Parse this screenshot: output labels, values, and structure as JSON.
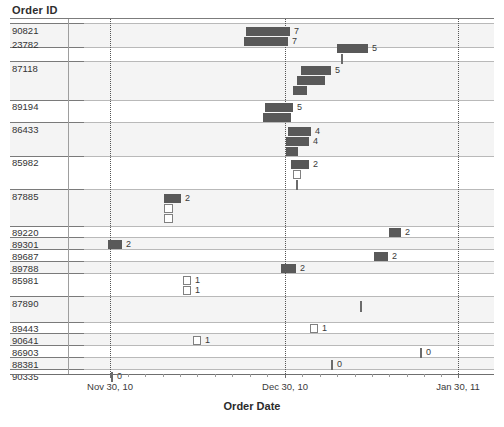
{
  "header": {
    "row_label_title": "Order ID"
  },
  "axis": {
    "title": "Order Date",
    "ticks": [
      {
        "label": "Nov 30, 10",
        "x": 110
      },
      {
        "label": "Dec 30, 10",
        "x": 285
      },
      {
        "label": "Jan 30, 11",
        "x": 458
      }
    ]
  },
  "colors": {
    "bar_fill": "#595959",
    "bar_hollow_stroke": "#808080",
    "band_fill": "#f4f4f4",
    "rule": "#b9b9b9",
    "grid": "#555555"
  },
  "chart_data": {
    "type": "bar",
    "title": "",
    "xlabel": "Order Date",
    "ylabel": "Order ID",
    "grid": true,
    "legend": null,
    "xtick_labels": [
      "Nov 30, 10",
      "Dec 30, 10",
      "Jan 30, 11"
    ],
    "categories": [
      "90821",
      "23782",
      "87118",
      "89194",
      "86433",
      "85982",
      "87885",
      "89220",
      "89301",
      "89687",
      "89788",
      "85981",
      "87890",
      "89443",
      "90641",
      "86903",
      "88381",
      "90335"
    ],
    "bars": [
      {
        "order_id": "90821",
        "value": 7,
        "start": 246,
        "end": 289
      },
      {
        "order_id": "90821",
        "value": 7,
        "start": 244,
        "end": 287
      },
      {
        "order_id": "23782",
        "value": 5,
        "start": 337,
        "end": 367
      },
      {
        "order_id": "23782",
        "value": null,
        "start": 341,
        "end": 342
      },
      {
        "order_id": "87118",
        "value": 5,
        "start": 301,
        "end": 330
      },
      {
        "order_id": "87118",
        "value": null,
        "start": 297,
        "end": 324
      },
      {
        "order_id": "87118",
        "value": null,
        "start": 293,
        "end": 306
      },
      {
        "order_id": "89194",
        "value": 5,
        "start": 265,
        "end": 292
      },
      {
        "order_id": "89194",
        "value": null,
        "start": 263,
        "end": 291
      },
      {
        "order_id": "86433",
        "value": 4,
        "start": 288,
        "end": 310
      },
      {
        "order_id": "86433",
        "value": 4,
        "start": 286,
        "end": 308
      },
      {
        "order_id": "85982",
        "value": null,
        "start": 286,
        "end": 296
      },
      {
        "order_id": "85982",
        "value": 2,
        "start": 291,
        "end": 308
      },
      {
        "order_id": "85982",
        "value": null,
        "start": 293,
        "end": 300
      },
      {
        "order_id": "85982",
        "value": null,
        "start": 296,
        "end": 297
      },
      {
        "order_id": "87885",
        "value": 2,
        "start": 164,
        "end": 180
      },
      {
        "order_id": "87885",
        "value": null,
        "start": 164,
        "end": 172
      },
      {
        "order_id": "87885",
        "value": null,
        "start": 164,
        "end": 172
      },
      {
        "order_id": "89220",
        "value": 2,
        "start": 389,
        "end": 400
      },
      {
        "order_id": "89301",
        "value": 2,
        "start": 108,
        "end": 122
      },
      {
        "order_id": "89687",
        "value": 2,
        "start": 374,
        "end": 388
      },
      {
        "order_id": "89788",
        "value": 2,
        "start": 281,
        "end": 296
      },
      {
        "order_id": "85981",
        "value": 1,
        "start": 183,
        "end": 190
      },
      {
        "order_id": "85981",
        "value": 1,
        "start": 183,
        "end": 190
      },
      {
        "order_id": "87890",
        "value": 1,
        "start": 360,
        "end": 361
      },
      {
        "order_id": "89443",
        "value": 1,
        "start": 310,
        "end": 317
      },
      {
        "order_id": "90641",
        "value": 1,
        "start": 193,
        "end": 200
      },
      {
        "order_id": "86903",
        "value": 0,
        "start": 420,
        "end": 421
      },
      {
        "order_id": "88381",
        "value": 0,
        "start": 331,
        "end": 332
      },
      {
        "order_id": "90335",
        "value": 0,
        "start": 111,
        "end": 112
      }
    ],
    "rows": [
      {
        "order_id": "90821",
        "label_y": 24,
        "height": 22,
        "items": [
          {
            "x": 236,
            "w": 44,
            "h": 9,
            "y": 3,
            "style": "solid",
            "value": "7"
          },
          {
            "x": 234,
            "w": 44,
            "h": 9,
            "y": 13,
            "style": "solid",
            "value": "7"
          }
        ]
      },
      {
        "order_id": "23782",
        "label_y": 38,
        "height": 24,
        "items": [
          {
            "x": 327,
            "w": 31,
            "h": 9,
            "y": 6,
            "style": "solid",
            "value": "5"
          },
          {
            "x": 331,
            "w": 2,
            "h": 10,
            "y": 16,
            "style": "tick",
            "value": ""
          }
        ]
      },
      {
        "order_id": "87118",
        "label_y": 62,
        "height": 38,
        "items": [
          {
            "x": 291,
            "w": 30,
            "h": 9,
            "y": 4,
            "style": "solid",
            "value": "5"
          },
          {
            "x": 287,
            "w": 28,
            "h": 9,
            "y": 14,
            "style": "solid",
            "value": ""
          },
          {
            "x": 283,
            "w": 14,
            "h": 9,
            "y": 24,
            "style": "solid",
            "value": ""
          }
        ]
      },
      {
        "order_id": "89194",
        "label_y": 100,
        "height": 23,
        "items": [
          {
            "x": 255,
            "w": 28,
            "h": 9,
            "y": 3,
            "style": "solid",
            "value": "5"
          },
          {
            "x": 253,
            "w": 28,
            "h": 9,
            "y": 13,
            "style": "solid",
            "value": ""
          }
        ]
      },
      {
        "order_id": "86433",
        "label_y": 123,
        "height": 33,
        "items": [
          {
            "x": 278,
            "w": 23,
            "h": 9,
            "y": 4,
            "style": "solid",
            "value": "4"
          },
          {
            "x": 276,
            "w": 23,
            "h": 9,
            "y": 14,
            "style": "solid",
            "value": "4"
          },
          {
            "x": 276,
            "w": 12,
            "h": 9,
            "y": 24,
            "style": "solid",
            "value": ""
          }
        ]
      },
      {
        "order_id": "85982",
        "label_y": 156,
        "height": 34,
        "items": [
          {
            "x": 281,
            "w": 18,
            "h": 9,
            "y": 4,
            "style": "solid",
            "value": "2"
          },
          {
            "x": 283,
            "w": 8,
            "h": 9,
            "y": 14,
            "style": "hollow",
            "value": ""
          },
          {
            "x": 286,
            "w": 2,
            "h": 10,
            "y": 24,
            "style": "tick",
            "value": ""
          }
        ]
      },
      {
        "order_id": "87885",
        "label_y": 190,
        "height": 36,
        "items": [
          {
            "x": 154,
            "w": 17,
            "h": 9,
            "y": 4,
            "style": "solid",
            "value": "2"
          },
          {
            "x": 154,
            "w": 9,
            "h": 9,
            "y": 14,
            "style": "hollow",
            "value": ""
          },
          {
            "x": 154,
            "w": 9,
            "h": 9,
            "y": 24,
            "style": "hollow",
            "value": ""
          }
        ]
      },
      {
        "order_id": "89220",
        "label_y": 226,
        "height": 12,
        "items": [
          {
            "x": 379,
            "w": 12,
            "h": 9,
            "y": 2,
            "style": "solid",
            "value": "2"
          }
        ]
      },
      {
        "order_id": "89301",
        "label_y": 238,
        "height": 12,
        "items": [
          {
            "x": 98,
            "w": 14,
            "h": 9,
            "y": 2,
            "style": "solid",
            "value": "2"
          }
        ]
      },
      {
        "order_id": "89687",
        "label_y": 250,
        "height": 12,
        "items": [
          {
            "x": 364,
            "w": 14,
            "h": 9,
            "y": 2,
            "style": "solid",
            "value": "2"
          }
        ]
      },
      {
        "order_id": "89788",
        "label_y": 262,
        "height": 12,
        "items": [
          {
            "x": 271,
            "w": 15,
            "h": 9,
            "y": 2,
            "style": "solid",
            "value": "2"
          }
        ]
      },
      {
        "order_id": "85981",
        "label_y": 274,
        "height": 23,
        "items": [
          {
            "x": 173,
            "w": 8,
            "h": 9,
            "y": 2,
            "style": "hollow",
            "value": "1"
          },
          {
            "x": 173,
            "w": 8,
            "h": 9,
            "y": 12,
            "style": "hollow",
            "value": "1"
          }
        ]
      },
      {
        "order_id": "87890",
        "label_y": 297,
        "height": 25,
        "items": [
          {
            "x": 350,
            "w": 2,
            "h": 11,
            "y": 4,
            "style": "tick",
            "value": ""
          }
        ]
      },
      {
        "order_id": "89443",
        "label_y": 322,
        "height": 12,
        "items": [
          {
            "x": 300,
            "w": 8,
            "h": 9,
            "y": 2,
            "style": "hollow",
            "value": "1"
          }
        ]
      },
      {
        "order_id": "90641",
        "label_y": 334,
        "height": 12,
        "items": [
          {
            "x": 183,
            "w": 8,
            "h": 9,
            "y": 2,
            "style": "hollow",
            "value": "1"
          }
        ]
      },
      {
        "order_id": "86903",
        "label_y": 346,
        "height": 12,
        "items": [
          {
            "x": 410,
            "w": 2,
            "h": 10,
            "y": 2,
            "style": "tick",
            "value": "0"
          }
        ]
      },
      {
        "order_id": "88381",
        "label_y": 358,
        "height": 12,
        "items": [
          {
            "x": 321,
            "w": 2,
            "h": 10,
            "y": 2,
            "style": "tick",
            "value": "0"
          }
        ]
      },
      {
        "order_id": "90335",
        "label_y": 370,
        "height": 14,
        "items": [
          {
            "x": 101,
            "w": 2,
            "h": 10,
            "y": 2,
            "style": "tick",
            "value": "0"
          }
        ]
      }
    ],
    "bands": [
      {
        "y": 23,
        "h": 24
      },
      {
        "y": 61,
        "h": 39
      },
      {
        "y": 122,
        "h": 34
      },
      {
        "y": 189,
        "h": 37
      },
      {
        "y": 237,
        "h": 12
      },
      {
        "y": 261,
        "h": 12
      },
      {
        "y": 296,
        "h": 26
      },
      {
        "y": 333,
        "h": 12
      },
      {
        "y": 357,
        "h": 12
      }
    ],
    "group_rules": [
      23,
      47,
      61,
      100,
      122,
      156,
      189,
      226,
      237,
      249,
      261,
      273,
      296,
      322,
      333,
      345,
      357,
      369
    ],
    "minor_ticks": [
      128,
      145,
      163,
      180,
      197,
      215,
      232,
      250,
      267,
      302,
      320,
      337,
      355,
      372,
      389,
      407,
      424,
      441
    ]
  }
}
